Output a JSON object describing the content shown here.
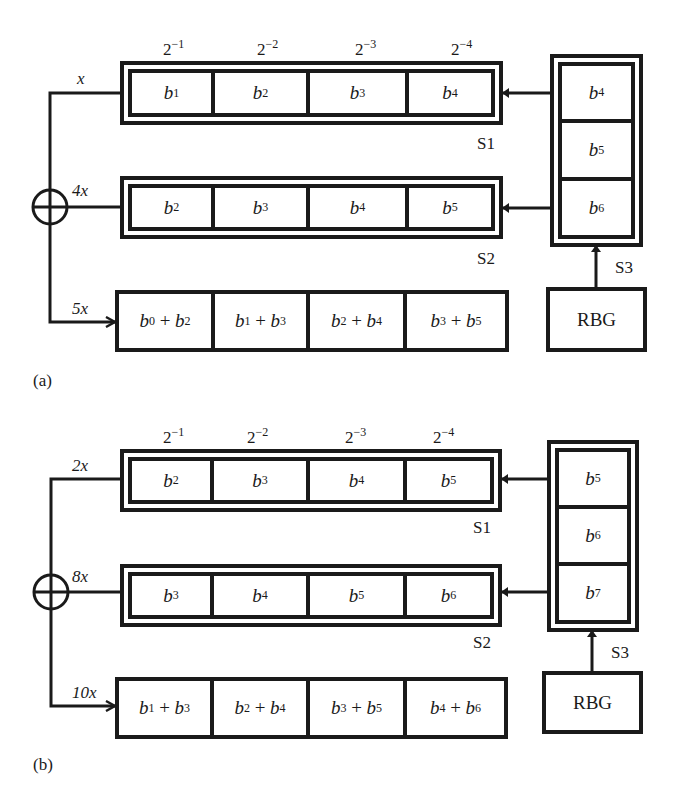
{
  "panels": [
    {
      "id": "a",
      "caption": "(a)",
      "weights": [
        "2",
        "2",
        "2",
        "2"
      ],
      "weight_exponents": [
        "−1",
        "−2",
        "−3",
        "−4"
      ],
      "wire_labels": {
        "top": "x",
        "middle": "4x",
        "bottom": "5x"
      },
      "register_s1": {
        "label": "S1",
        "cells": [
          [
            "b",
            "1"
          ],
          [
            "b",
            "2"
          ],
          [
            "b",
            "3"
          ],
          [
            "b",
            "4"
          ]
        ]
      },
      "register_s2": {
        "label": "S2",
        "cells": [
          [
            "b",
            "2"
          ],
          [
            "b",
            "3"
          ],
          [
            "b",
            "4"
          ],
          [
            "b",
            "5"
          ]
        ]
      },
      "register_s3": {
        "label": "S3",
        "cells": [
          [
            "b",
            "4"
          ],
          [
            "b",
            "5"
          ],
          [
            "b",
            "6"
          ]
        ]
      },
      "result": {
        "cells": [
          [
            "b",
            "0",
            "b",
            "2"
          ],
          [
            "b",
            "1",
            "b",
            "3"
          ],
          [
            "b",
            "2",
            "b",
            "4"
          ],
          [
            "b",
            "3",
            "b",
            "5"
          ]
        ]
      },
      "rbg_label": "RBG",
      "adder_symbol": "⊕"
    },
    {
      "id": "b",
      "caption": "(b)",
      "weights": [
        "2",
        "2",
        "2",
        "2"
      ],
      "weight_exponents": [
        "−1",
        "−2",
        "−3",
        "−4"
      ],
      "wire_labels": {
        "top": "2x",
        "middle": "8x",
        "bottom": "10x"
      },
      "register_s1": {
        "label": "S1",
        "cells": [
          [
            "b",
            "2"
          ],
          [
            "b",
            "3"
          ],
          [
            "b",
            "4"
          ],
          [
            "b",
            "5"
          ]
        ]
      },
      "register_s2": {
        "label": "S2",
        "cells": [
          [
            "b",
            "3"
          ],
          [
            "b",
            "4"
          ],
          [
            "b",
            "5"
          ],
          [
            "b",
            "6"
          ]
        ]
      },
      "register_s3": {
        "label": "S3",
        "cells": [
          [
            "b",
            "5"
          ],
          [
            "b",
            "6"
          ],
          [
            "b",
            "7"
          ]
        ]
      },
      "result": {
        "cells": [
          [
            "b",
            "1",
            "b",
            "3"
          ],
          [
            "b",
            "2",
            "b",
            "4"
          ],
          [
            "b",
            "3",
            "b",
            "5"
          ],
          [
            "b",
            "4",
            "b",
            "6"
          ]
        ]
      },
      "rbg_label": "RBG",
      "adder_symbol": "⊕"
    }
  ],
  "plus": "+"
}
